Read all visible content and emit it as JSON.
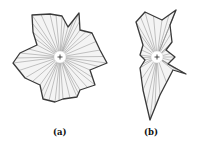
{
  "figure": {
    "panels": [
      {
        "id": "a",
        "label": "(a)",
        "center": [
          60,
          57
        ],
        "outline": [
          [
            32,
            15
          ],
          [
            50,
            14
          ],
          [
            62,
            16
          ],
          [
            68,
            27
          ],
          [
            79,
            13
          ],
          [
            80,
            30
          ],
          [
            92,
            33
          ],
          [
            100,
            50
          ],
          [
            107,
            63
          ],
          [
            90,
            70
          ],
          [
            95,
            85
          ],
          [
            80,
            90
          ],
          [
            77,
            97
          ],
          [
            63,
            99
          ],
          [
            55,
            102
          ],
          [
            43,
            99
          ],
          [
            40,
            85
          ],
          [
            25,
            78
          ],
          [
            13,
            63
          ],
          [
            20,
            53
          ],
          [
            37,
            45
          ],
          [
            33,
            32
          ]
        ]
      },
      {
        "id": "b",
        "label": "(b)",
        "center": [
          157,
          57
        ],
        "outline": [
          [
            145,
            12
          ],
          [
            162,
            20
          ],
          [
            176,
            10
          ],
          [
            170,
            25
          ],
          [
            172,
            42
          ],
          [
            166,
            50
          ],
          [
            175,
            57
          ],
          [
            168,
            64
          ],
          [
            186,
            74
          ],
          [
            173,
            70
          ],
          [
            160,
            95
          ],
          [
            150,
            120
          ],
          [
            143,
            90
          ],
          [
            140,
            68
          ],
          [
            145,
            60
          ],
          [
            140,
            55
          ],
          [
            143,
            45
          ],
          [
            136,
            22
          ]
        ]
      }
    ],
    "colors": {
      "outline": "#3a3a3a",
      "spokes": "#8a8a8a",
      "fill": "#f4f4f4"
    }
  }
}
